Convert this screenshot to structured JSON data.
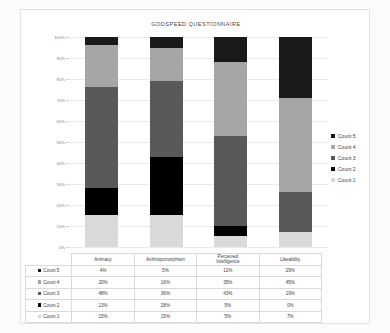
{
  "chart_data": {
    "type": "bar",
    "subtype": "100% stacked column",
    "title": "GODSPEED QUESTIONNAIRE",
    "xlabel": "",
    "ylabel": "",
    "ylim": [
      0,
      100
    ],
    "ytick_labels": [
      "100%",
      "90%",
      "80%",
      "70%",
      "60%",
      "50%",
      "40%",
      "30%",
      "20%",
      "10%",
      "0%"
    ],
    "ytick_values": [
      100,
      90,
      80,
      70,
      60,
      50,
      40,
      30,
      20,
      10,
      0
    ],
    "grid": true,
    "legend_position": "right",
    "categories": [
      "Animacy",
      "Anthropomorphism",
      "Perceived Intelligence",
      "Likeability"
    ],
    "category_lines": [
      [
        "Animacy"
      ],
      [
        "Anthropomorphism"
      ],
      [
        "Perceived",
        "Intelligence"
      ],
      [
        "Likeability"
      ]
    ],
    "stack_order_top_to_bottom": [
      "Count 5",
      "Count 4",
      "Count 3",
      "Count 2",
      "Count 1"
    ],
    "series": [
      {
        "name": "Count 5",
        "color": "#1a1a1a",
        "values": [
          4,
          5,
          12,
          29
        ],
        "labels": [
          "4%",
          "5%",
          "12%",
          "29%"
        ]
      },
      {
        "name": "Count 4",
        "color": "#a6a6a6",
        "values": [
          20,
          16,
          35,
          45
        ],
        "labels": [
          "20%",
          "16%",
          "35%",
          "45%"
        ]
      },
      {
        "name": "Count 3",
        "color": "#595959",
        "values": [
          48,
          36,
          43,
          19
        ],
        "labels": [
          "48%",
          "36%",
          "43%",
          "19%"
        ]
      },
      {
        "name": "Count 2",
        "color": "#000000",
        "values": [
          13,
          28,
          5,
          0
        ],
        "labels": [
          "13%",
          "28%",
          "5%",
          "0%"
        ]
      },
      {
        "name": "Count 1",
        "color": "#d9d9d9",
        "values": [
          15,
          15,
          5,
          7
        ],
        "labels": [
          "15%",
          "15%",
          "5%",
          "7%"
        ]
      }
    ]
  },
  "legend": {
    "items": [
      {
        "label": "Count 5",
        "color": "#1a1a1a"
      },
      {
        "label": "Count 4",
        "color": "#a6a6a6"
      },
      {
        "label": "Count 3",
        "color": "#595959"
      },
      {
        "label": "Count 2",
        "color": "#000000"
      },
      {
        "label": "Count 1",
        "color": "#d9d9d9"
      }
    ]
  },
  "table": {
    "corner": "",
    "column_headers": [
      "Animacy",
      "Anthropomorphism",
      "Perceived Intelligence",
      "Likeability"
    ],
    "rows": [
      {
        "key": "Count 5",
        "color": "#1a1a1a",
        "cells": [
          "4%",
          "5%",
          "12%",
          "29%"
        ]
      },
      {
        "key": "Count 4",
        "color": "#a6a6a6",
        "cells": [
          "20%",
          "16%",
          "35%",
          "45%"
        ]
      },
      {
        "key": "Count 3",
        "color": "#595959",
        "cells": [
          "48%",
          "36%",
          "43%",
          "19%"
        ]
      },
      {
        "key": "Count 2",
        "color": "#000000",
        "cells": [
          "13%",
          "28%",
          "5%",
          "0%"
        ]
      },
      {
        "key": "Count 1",
        "color": "#d9d9d9",
        "cells": [
          "15%",
          "15%",
          "5%",
          "7%"
        ]
      }
    ]
  }
}
